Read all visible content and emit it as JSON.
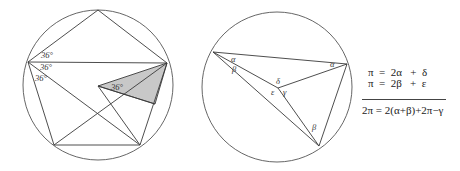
{
  "figure_left": {
    "circle": {
      "cx": 98,
      "cy": 85,
      "r": 75
    },
    "angle_labels": [
      {
        "text": "36°",
        "x": 41,
        "y": 58
      },
      {
        "text": "36°",
        "x": 40,
        "y": 70
      },
      {
        "text": "36°",
        "x": 36,
        "y": 81
      },
      {
        "text": "36°",
        "x": 111,
        "y": 90
      }
    ]
  },
  "figure_middle": {
    "circle": {
      "cx": 277,
      "cy": 87,
      "r": 75
    },
    "angle_labels": [
      {
        "text": "α",
        "x": 231,
        "y": 62
      },
      {
        "text": "β",
        "x": 232,
        "y": 72
      },
      {
        "text": "α",
        "x": 330,
        "y": 67
      },
      {
        "text": "δ",
        "x": 276,
        "y": 84
      },
      {
        "text": "ε",
        "x": 271,
        "y": 95
      },
      {
        "text": "γ",
        "x": 283,
        "y": 95
      },
      {
        "text": "β",
        "x": 312,
        "y": 130
      }
    ]
  },
  "equations": {
    "line1": "π  =  2α   +  δ",
    "line2": "π  =  2β   +  ε",
    "result": "2π = 2(α+β)+2π−γ"
  },
  "colors": {
    "stroke": "#3a3a3a",
    "shade": "#c8c8c8",
    "background": "#ffffff"
  }
}
